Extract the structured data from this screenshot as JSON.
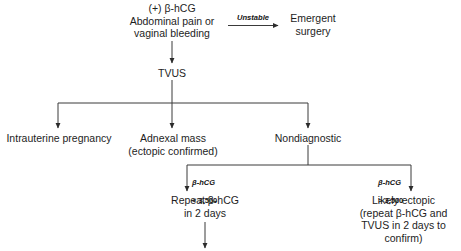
{
  "diagram": {
    "line_color": "#3a3a3a",
    "text_color": "#1d1d1d",
    "background": "#ffffff"
  },
  "nodes": {
    "start": "(+) β-hCG\nAbdominal pain or\nvaginal bleeding",
    "emergent_surgery": "Emergent\nsurgery",
    "tvus": "TVUS",
    "intrauterine": "Intrauterine pregnancy",
    "adnexal": "Adnexal mass\n(ectopic confirmed)",
    "nondiagnostic": "Nondiagnostic",
    "repeat": "Repeat β-hCG\nin 2 days",
    "likely_ectopic": "Likely ectopic\n(repeat β-hCG and\nTVUS in 2 days to\nconfirm)"
  },
  "edge_labels": {
    "unstable": "Unstable",
    "hcg_low_marker": "β-hCG",
    "hcg_low_value": "< 3,500",
    "hcg_high_marker": "β-hCG",
    "hcg_high_value": "> 3,500"
  }
}
